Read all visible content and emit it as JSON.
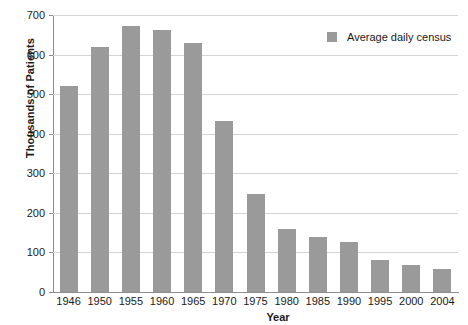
{
  "chart_data": {
    "type": "bar",
    "title": "",
    "xlabel": "Year",
    "ylabel": "Thousands of Patients",
    "categories": [
      "1946",
      "1950",
      "1955",
      "1960",
      "1965",
      "1970",
      "1975",
      "1980",
      "1985",
      "1990",
      "1995",
      "2000",
      "2004"
    ],
    "values": [
      520,
      620,
      672,
      662,
      630,
      432,
      247,
      160,
      139,
      127,
      80,
      67,
      58
    ],
    "series": [
      {
        "name": "Average daily census",
        "color": "#9a9a9a",
        "values": [
          520,
          620,
          672,
          662,
          630,
          432,
          247,
          160,
          139,
          127,
          80,
          67,
          58
        ]
      }
    ],
    "ylim": [
      0,
      700
    ],
    "ytick_step": 100,
    "yticks": [
      "700",
      "600",
      "500",
      "400",
      "300",
      "200",
      "100",
      "0"
    ],
    "ytick_values": [
      700,
      600,
      500,
      400,
      300,
      200,
      100,
      0
    ],
    "grid": true,
    "grid_axis": "y",
    "legend": {
      "position": "top-right-inside",
      "entries": [
        {
          "label": "Average daily census",
          "color": "#9a9a9a"
        }
      ]
    },
    "colors": {
      "bar": "#9a9a9a",
      "gridline": "#d4d4d4",
      "axis": "#8c8c8c",
      "text": "#1a1a1a",
      "background": "#ffffff"
    }
  }
}
